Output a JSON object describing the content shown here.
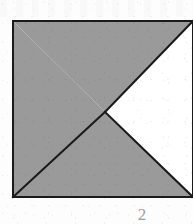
{
  "figure": {
    "caption": "2",
    "background_color": "#fdfdfd",
    "fill_color": "#9a9a9a",
    "empty_color": "#ffffff",
    "stroke_color": "#1a1a1a",
    "stroke_width": 2,
    "square": {
      "left": 13,
      "top": 21,
      "right": 193,
      "bottom": 197
    },
    "center_vertex": {
      "x": 105,
      "y": 112
    },
    "regions": [
      {
        "name": "upper-left-gray-triangle",
        "fill": "#9a9a9a",
        "points": "13,21 193,21 105,112"
      },
      {
        "name": "left-gray-triangle",
        "fill": "#9a9a9a",
        "points": "13,21 105,112 13,197"
      },
      {
        "name": "lower-gray-triangle",
        "fill": "#9a9a9a",
        "points": "13,197 105,112 193,197"
      },
      {
        "name": "right-white-triangle",
        "fill": "#ffffff",
        "points": "105,112 193,21 193,197"
      }
    ],
    "edges": [
      {
        "name": "square-outline",
        "points": "13,21 193,21 193,197 13,197 13,21"
      },
      {
        "name": "diagonal-center-to-top-right",
        "points": "105,112 193,21"
      },
      {
        "name": "diagonal-center-to-bottom-left",
        "points": "105,112 13,197"
      },
      {
        "name": "diagonal-center-to-bottom-right",
        "points": "105,112 193,197"
      }
    ]
  }
}
